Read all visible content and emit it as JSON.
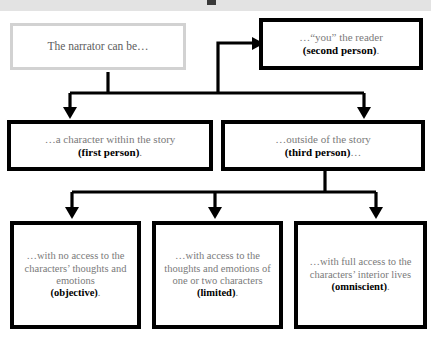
{
  "document": {
    "title": "Narrator point of view flowchart",
    "header_strip_color": "#e3e3e3",
    "background_color": "#ffffff"
  },
  "colors": {
    "body_text": "#7a7a7a",
    "term_text": "#000000",
    "root_border": "#d2d2d2",
    "node_border": "#000000",
    "connector": "#000000"
  },
  "diagram": {
    "type": "flowchart",
    "orientation": "top-down",
    "root": {
      "id": "narrator-root",
      "label": "The narrator can be…",
      "border_style": "light-gray"
    },
    "level_two": [
      {
        "id": "second-person",
        "lead": "…“you” the reader",
        "term": "(second person)",
        "trailing": ".",
        "border_style": "heavy-black"
      },
      {
        "id": "first-person",
        "lead": "…a character within the story",
        "term": "(first person)",
        "trailing": ".",
        "border_style": "heavy-black"
      },
      {
        "id": "third-person",
        "lead": "…outside of the story",
        "term": "(third person)",
        "trailing": "…",
        "border_style": "heavy-black"
      }
    ],
    "level_three": [
      {
        "id": "objective",
        "lead": "…with no access to the characters’ thoughts and emotions",
        "term": "(objective)",
        "trailing": ".",
        "border_style": "heavy-black"
      },
      {
        "id": "limited",
        "lead": "…with access to the thoughts and emotions of one or two characters",
        "term": "(limited)",
        "trailing": ".",
        "border_style": "heavy-black"
      },
      {
        "id": "omniscient",
        "lead": "…with full access to the characters’ interior lives",
        "term": "(omniscient)",
        "trailing": ".",
        "border_style": "heavy-black"
      }
    ],
    "connectors": [
      {
        "from": "narrator-root",
        "to": "second-person",
        "style": "elbow-arrow"
      },
      {
        "from": "narrator-root",
        "to": "first-person",
        "style": "down-arrow"
      },
      {
        "from": "narrator-root",
        "to": "third-person",
        "style": "down-arrow"
      },
      {
        "from": "third-person",
        "to": "objective",
        "style": "down-arrow"
      },
      {
        "from": "third-person",
        "to": "limited",
        "style": "down-arrow"
      },
      {
        "from": "third-person",
        "to": "omniscient",
        "style": "down-arrow"
      }
    ]
  }
}
